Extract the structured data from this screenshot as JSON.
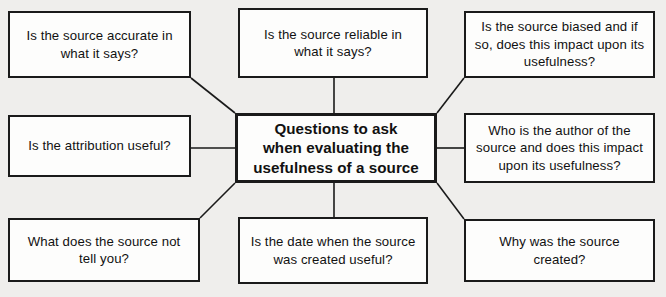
{
  "diagram": {
    "title": "Questions to ask when evaluating the usefulness of a source",
    "type": "mind-map",
    "background_color": "#efeeec",
    "box_fill_color": "#fdfdfc",
    "box_border_color": "#1a1a1a",
    "text_color": "#111111",
    "center": {
      "id": "center",
      "label": "Questions to ask\nwhen evaluating the\nusefulness of a source",
      "bold": true
    },
    "nodes": [
      {
        "id": "top-left",
        "position": "top-left",
        "label": "Is the source accurate in\nwhat it says?"
      },
      {
        "id": "top-center",
        "position": "top-center",
        "label": "Is the source reliable in\nwhat it says?"
      },
      {
        "id": "top-right",
        "position": "top-right",
        "label": "Is the source biased and if\nso, does this impact upon its\nusefulness?"
      },
      {
        "id": "middle-left",
        "position": "middle-left",
        "label": "Is the attribution useful?"
      },
      {
        "id": "middle-right",
        "position": "middle-right",
        "label": "Who is the author of the\nsource and does this impact\nupon its usefulness?"
      },
      {
        "id": "bottom-left",
        "position": "bottom-left",
        "label": "What does the source not\ntell you?"
      },
      {
        "id": "bottom-center",
        "position": "bottom-center",
        "label": "Is the date when the source\nwas created useful?"
      },
      {
        "id": "bottom-right",
        "position": "bottom-right",
        "label": "Why was the source\ncreated?"
      }
    ],
    "connectors": [
      {
        "from": "center",
        "to": "top-left",
        "style": "diagonal"
      },
      {
        "from": "center",
        "to": "top-center",
        "style": "vertical"
      },
      {
        "from": "center",
        "to": "top-right",
        "style": "diagonal"
      },
      {
        "from": "center",
        "to": "middle-left",
        "style": "horizontal"
      },
      {
        "from": "center",
        "to": "middle-right",
        "style": "horizontal"
      },
      {
        "from": "center",
        "to": "bottom-left",
        "style": "diagonal"
      },
      {
        "from": "center",
        "to": "bottom-center",
        "style": "vertical"
      },
      {
        "from": "center",
        "to": "bottom-right",
        "style": "diagonal"
      }
    ]
  }
}
